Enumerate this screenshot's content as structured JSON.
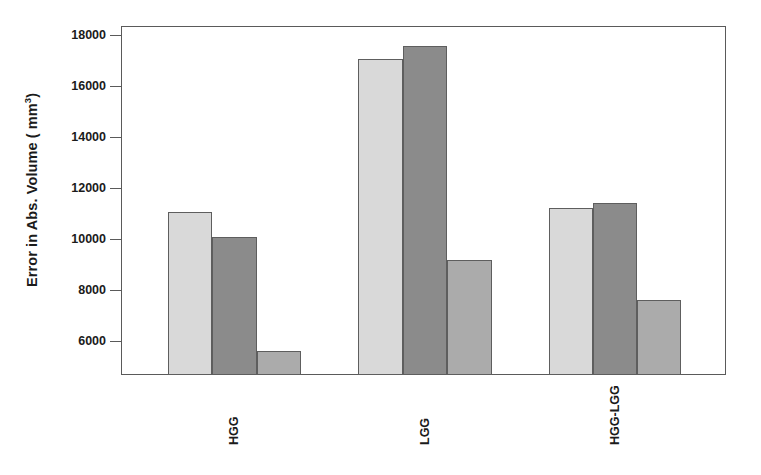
{
  "chart_data": {
    "type": "bar",
    "title": "",
    "xlabel": "",
    "ylabel": "Error in Abs. Volume ( mm",
    "ylabel_exponent": "3",
    "ylabel_suffix": ")",
    "categories": [
      "HGG",
      "LGG",
      "HGG-LGG"
    ],
    "series": [
      {
        "name": "series-1",
        "color": "#d9d9d9",
        "values": [
          11100,
          17100,
          11250
        ]
      },
      {
        "name": "series-2",
        "color": "#8b8b8b",
        "values": [
          10100,
          17600,
          11450
        ]
      },
      {
        "name": "series-3",
        "color": "#ababab",
        "values": [
          5650,
          9200,
          7650
        ]
      }
    ],
    "yticks": [
      6000,
      8000,
      10000,
      12000,
      14000,
      16000,
      18000
    ],
    "ytick_labels": [
      "6000",
      "8000",
      "10000",
      "12000",
      "14000",
      "16000",
      "18000"
    ],
    "ylim": [
      4690,
      18380
    ],
    "grid": false,
    "legend": "none",
    "axis_color": "#5a5a5a",
    "bar_edge_color": "#5e5e5e",
    "background": "#ffffff"
  }
}
